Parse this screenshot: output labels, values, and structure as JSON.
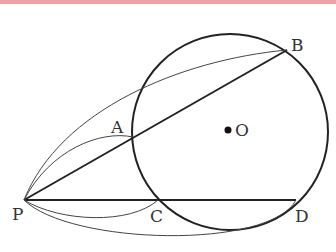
{
  "accent_bar_color": "#f2a0a4",
  "diagram": {
    "circle": {
      "center_label": "O",
      "cx": 230,
      "cy": 132,
      "r": 98
    },
    "points": {
      "P": {
        "label": "P",
        "x": 24,
        "y": 200
      },
      "A": {
        "label": "A",
        "x": 133,
        "y": 137
      },
      "B": {
        "label": "B",
        "x": 287,
        "y": 50
      },
      "C": {
        "label": "C",
        "x": 158,
        "y": 200
      },
      "D": {
        "label": "D",
        "x": 296,
        "y": 200
      },
      "O": {
        "label": "O",
        "x": 228,
        "y": 130
      }
    },
    "segments": [
      "PB",
      "PD"
    ],
    "curved_arrows": [
      "P→A",
      "P→B",
      "P→C",
      "P→D"
    ]
  }
}
